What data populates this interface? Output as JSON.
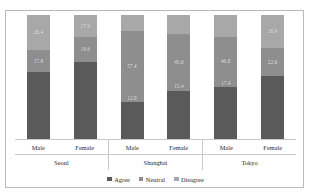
{
  "chart_data": {
    "type": "bar",
    "subtype": "stacked-percentage",
    "title": "",
    "xlabel": "",
    "ylabel": "",
    "ylim": [
      0,
      100
    ],
    "grid": false,
    "legend_position": "bottom",
    "orientation": "vertical",
    "groups": [
      "Seoul",
      "Shanghai",
      "Tokyo"
    ],
    "subcategories": [
      "Male",
      "Female"
    ],
    "categories": [
      "Seoul Male",
      "Seoul Female",
      "Shanghai Male",
      "Shanghai Female",
      "Tokyo Male",
      "Tokyo Female"
    ],
    "series": [
      {
        "name": "Agree",
        "color": "#5a5a5a",
        "values": [
          53.8,
          62.5,
          29.7,
          39.0,
          41.8,
          50.5
        ]
      },
      {
        "name": "Neutral",
        "color": "#8e8e8e",
        "values": [
          17.8,
          19.6,
          57.4,
          45.6,
          40.8,
          22.6
        ]
      },
      {
        "name": "Disagree",
        "color": "#a8a8a8",
        "values": [
          28.4,
          17.9,
          12.9,
          15.4,
          17.4,
          26.9
        ]
      }
    ],
    "data_labels_shown": [
      "Neutral",
      "Disagree"
    ]
  },
  "colors": {
    "agree": "#5a5a5a",
    "neutral": "#8e8e8e",
    "disagree": "#a8a8a8",
    "frame": "#b9b9b9",
    "axis_line": "#c9c9c9",
    "text": "#2b2b2b",
    "label_text": "#f2f2f2",
    "background": "#ffffff"
  },
  "legend": {
    "items": [
      {
        "label": "Agree",
        "color": "#5a5a5a"
      },
      {
        "label": "Neutral",
        "color": "#8e8e8e"
      },
      {
        "label": "Disagree",
        "color": "#a8a8a8"
      }
    ]
  },
  "axis": {
    "groups": [
      {
        "city": "Seoul",
        "bars": [
          {
            "gender": "Male",
            "agree": 53.8,
            "neutral": 17.8,
            "disagree": 28.4,
            "neutral_label": "17.8",
            "disagree_label": "28.4"
          },
          {
            "gender": "Female",
            "agree": 62.5,
            "neutral": 19.6,
            "disagree": 17.9,
            "neutral_label": "19.6",
            "disagree_label": "17.9"
          }
        ]
      },
      {
        "city": "Shanghai",
        "bars": [
          {
            "gender": "Male",
            "agree": 29.7,
            "neutral": 57.4,
            "disagree": 12.9,
            "neutral_label": "57.4",
            "disagree_label": "12.9"
          },
          {
            "gender": "Female",
            "agree": 39.0,
            "neutral": 45.6,
            "disagree": 15.4,
            "neutral_label": "45.6",
            "disagree_label": "15.4"
          }
        ]
      },
      {
        "city": "Tokyo",
        "bars": [
          {
            "gender": "Male",
            "agree": 41.8,
            "neutral": 40.8,
            "disagree": 17.4,
            "neutral_label": "40.8",
            "disagree_label": "17.4"
          },
          {
            "gender": "Female",
            "agree": 50.5,
            "neutral": 22.6,
            "disagree": 26.9,
            "neutral_label": "22.6",
            "disagree_label": "26.9"
          }
        ]
      }
    ]
  }
}
